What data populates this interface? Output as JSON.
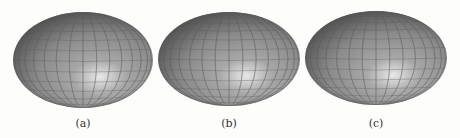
{
  "figure": {
    "panels": [
      {
        "label": "(a)",
        "cx": 83,
        "cy": 60,
        "rx": 70,
        "ry": 48
      },
      {
        "label": "(b)",
        "cx": 229,
        "cy": 59,
        "rx": 71,
        "ry": 47
      },
      {
        "label": "(c)",
        "cx": 376,
        "cy": 58,
        "rx": 71,
        "ry": 47
      }
    ],
    "colors": {
      "surface": "#8a8a8a",
      "highlight": "#e8e8e8",
      "shadow": "#4a4a4a",
      "grid": "#5a5a5a"
    }
  }
}
